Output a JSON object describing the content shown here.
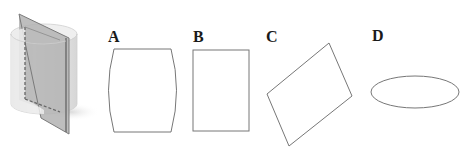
{
  "figure": {
    "solid": "cylinder-cut-by-plane",
    "options": [
      {
        "label": "A",
        "shape": "barrel-shape"
      },
      {
        "label": "B",
        "shape": "rectangle"
      },
      {
        "label": "C",
        "shape": "parallelogram"
      },
      {
        "label": "D",
        "shape": "ellipse"
      }
    ]
  },
  "colors": {
    "outline": "#777777",
    "plane": "#a8a8a8",
    "plane_edge": "#6f6f6f",
    "cylinder": "#ececec",
    "dashes": "#666666"
  }
}
